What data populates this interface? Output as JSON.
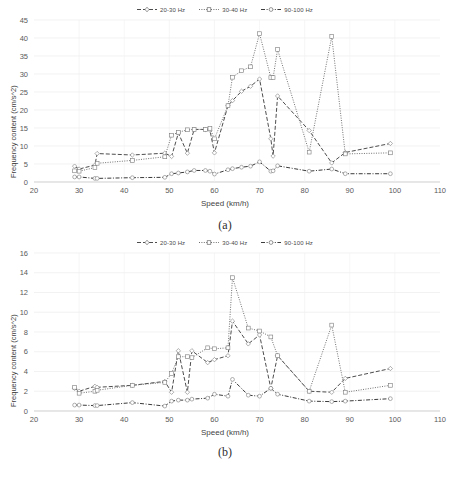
{
  "figure": {
    "panels": [
      {
        "caption": "(a)",
        "legend": [
          {
            "label": "20-30 Hz",
            "style": "dashed",
            "marker": "diamond"
          },
          {
            "label": "30-40 Hz",
            "style": "dotted",
            "marker": "square"
          },
          {
            "label": "90-100 Hz",
            "style": "dashdot",
            "marker": "circle"
          }
        ],
        "chart_data": {
          "type": "line",
          "title": "",
          "xlabel": "Speed (km/h)",
          "ylabel": "Frequency content (cm/s^2)",
          "xlim": [
            20,
            110
          ],
          "ylim": [
            0,
            45
          ],
          "xticks": [
            20,
            30,
            40,
            50,
            60,
            70,
            80,
            90,
            100,
            110
          ],
          "yticks": [
            0,
            5,
            10,
            15,
            20,
            25,
            30,
            35,
            40,
            45
          ],
          "grid": true,
          "legend_position": "top-center",
          "x": [
            29,
            30,
            33.5,
            34,
            41.8,
            49,
            50.5,
            52,
            54,
            55.5,
            58,
            59,
            60,
            63,
            64,
            66,
            68,
            70,
            72.5,
            73,
            74,
            81,
            86,
            89,
            99
          ],
          "series": [
            {
              "name": "20-30 Hz",
              "style": "dashed",
              "marker": "diamond",
              "values": [
                4.4,
                3.6,
                4.7,
                7.9,
                7.5,
                8.0,
                7.1,
                13.6,
                8.0,
                14.6,
                14.6,
                14.4,
                8.1,
                21.2,
                22.6,
                25.2,
                26.6,
                28.6,
                12.0,
                7.2,
                23.9,
                14.3,
                5.3,
                8.2,
                10.7
              ]
            },
            {
              "name": "30-40 Hz",
              "style": "dotted",
              "marker": "square",
              "values": [
                3.1,
                3.0,
                4.0,
                5.2,
                6.0,
                7.0,
                13.0,
                13.8,
                14.5,
                14.6,
                14.6,
                14.9,
                12.0,
                21.2,
                29.1,
                30.9,
                32.0,
                41.2,
                29.0,
                29.0,
                36.8,
                8.3,
                40.4,
                7.8,
                8.1
              ]
            },
            {
              "name": "90-100 Hz",
              "style": "dashdot",
              "marker": "circle",
              "values": [
                1.4,
                1.4,
                1.0,
                1.0,
                1.2,
                1.3,
                2.3,
                2.5,
                2.8,
                3.2,
                3.2,
                3.0,
                2.2,
                3.4,
                3.7,
                4.1,
                4.4,
                5.6,
                3.0,
                3.1,
                4.5,
                3.0,
                3.6,
                2.3,
                2.3
              ]
            }
          ]
        }
      },
      {
        "caption": "(b)",
        "legend": [
          {
            "label": "20-30 Hz",
            "style": "dashed",
            "marker": "diamond"
          },
          {
            "label": "30-40 Hz",
            "style": "dotted",
            "marker": "square"
          },
          {
            "label": "90-100 Hz",
            "style": "dashdot",
            "marker": "circle"
          }
        ],
        "chart_data": {
          "type": "line",
          "title": "",
          "xlabel": "Speed (km/h)",
          "ylabel": "Frequency content (cm/s^2)",
          "xlim": [
            20,
            110
          ],
          "ylim": [
            0,
            16
          ],
          "xticks": [
            20,
            30,
            40,
            50,
            60,
            70,
            80,
            90,
            100,
            110
          ],
          "yticks": [
            0,
            2,
            4,
            6,
            8,
            10,
            12,
            14,
            16
          ],
          "grid": true,
          "legend_position": "top-center",
          "x": [
            29,
            30,
            33.5,
            34,
            41.8,
            49,
            50.5,
            52,
            54,
            55,
            58.5,
            60,
            63,
            64,
            67.5,
            70,
            72.5,
            74,
            81,
            86,
            89,
            99
          ],
          "series": [
            {
              "name": "20-30 Hz",
              "style": "dashed",
              "marker": "diamond",
              "values": [
                2.3,
                2.0,
                2.5,
                2.4,
                2.6,
                3.0,
                1.9,
                6.1,
                1.9,
                6.1,
                4.9,
                5.2,
                5.6,
                9.1,
                6.8,
                7.7,
                2.3,
                5.6,
                2.0,
                1.9,
                3.3,
                4.3
              ]
            },
            {
              "name": "30-40 Hz",
              "style": "dotted",
              "marker": "square",
              "values": [
                2.4,
                1.8,
                2.0,
                2.1,
                2.6,
                2.9,
                3.8,
                5.5,
                5.5,
                5.4,
                6.4,
                6.3,
                6.4,
                13.5,
                8.4,
                8.1,
                7.5,
                5.6,
                2.0,
                8.7,
                1.9,
                2.6
              ]
            },
            {
              "name": "90-100 Hz",
              "style": "dashdot",
              "marker": "circle",
              "values": [
                0.6,
                0.6,
                0.55,
                0.55,
                0.85,
                0.5,
                1.0,
                1.1,
                1.1,
                1.2,
                1.3,
                1.7,
                1.5,
                3.2,
                1.6,
                1.5,
                2.3,
                1.7,
                1.0,
                0.95,
                1.0,
                1.25
              ]
            }
          ]
        }
      }
    ]
  }
}
